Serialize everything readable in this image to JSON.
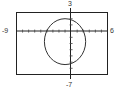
{
  "chart_data": {
    "type": "line",
    "title": "",
    "xlabel": "",
    "ylabel": "",
    "xlim": [
      -9,
      6
    ],
    "ylim": [
      -7,
      3
    ],
    "grid": false,
    "tick_marks_x": "every 1 unit",
    "window_labels": {
      "xmin": "-9",
      "xmax": "6",
      "ymax": "3",
      "ymin": "-7"
    },
    "series": [
      {
        "name": "closed curve (ellipse)",
        "shape": "ellipse",
        "center": [
          -1,
          -1.7
        ],
        "semi_axis_x": 3.4,
        "semi_axis_y": 3.7,
        "approx_extents": {
          "xmin": -4.3,
          "xmax": 2.4,
          "ymax": 2.1,
          "ymin": -5.4
        }
      }
    ]
  },
  "labels": {
    "left": "-9",
    "right": "6",
    "top": "3",
    "bottom": "-7"
  },
  "colors": {
    "frame": "#222222",
    "axis": "#222222",
    "curve": "#333333"
  }
}
